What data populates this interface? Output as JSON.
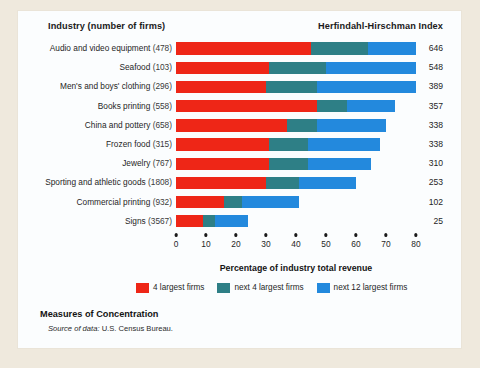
{
  "header": {
    "industry_column": "Industry (number of firms)",
    "index_column": "Herfindahl-Hirschman Index"
  },
  "caption": {
    "title": "Measures of Concentration",
    "source_label": "Source of data:",
    "source_value": " U.S. Census Bureau."
  },
  "colors": {
    "series_1": "#ee2617",
    "series_2": "#2e7f86",
    "series_3": "#2389dd",
    "page_background": "#efe9dd",
    "card_background": "#fbfdfe"
  },
  "chart_data": {
    "type": "bar",
    "orientation": "horizontal",
    "stacked": true,
    "title": "Measures of Concentration",
    "xlabel": "Percentage of industry total revenue",
    "ylabel": "",
    "xlim": [
      0,
      80
    ],
    "xticks": [
      0,
      10,
      20,
      30,
      40,
      50,
      60,
      70,
      80
    ],
    "grid": false,
    "legend_position": "bottom",
    "categories": [
      "Audio and video equipment",
      "Seafood",
      "Men's and boys' clothing",
      "Books printing",
      "China and pottery",
      "Frozen food",
      "Jewelry",
      "Sporting and athletic goods",
      "Commercial printing",
      "Signs"
    ],
    "firm_counts": [
      478,
      103,
      296,
      558,
      658,
      315,
      767,
      1808,
      932,
      3567
    ],
    "series": [
      {
        "name": "4 largest firms",
        "color": "#ee2617",
        "values": [
          45,
          31,
          30,
          47,
          37,
          31,
          31,
          30,
          16,
          9
        ]
      },
      {
        "name": "next 4 largest firms",
        "color": "#2e7f86",
        "values": [
          19,
          19,
          17,
          10,
          10,
          13,
          13,
          11,
          6,
          4
        ]
      },
      {
        "name": "next 12 largest firms",
        "color": "#2389dd",
        "values": [
          16,
          30,
          33,
          16,
          23,
          24,
          21,
          19,
          19,
          11
        ]
      }
    ],
    "totals": [
      80,
      80,
      80,
      73,
      70,
      68,
      65,
      60,
      41,
      24
    ],
    "hhi_label": "Herfindahl-Hirschman Index",
    "hhi_values": [
      646,
      548,
      389,
      357,
      338,
      338,
      310,
      253,
      102,
      25
    ]
  }
}
